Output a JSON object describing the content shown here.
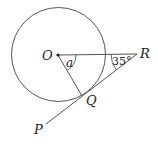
{
  "diagram": {
    "type": "geometry",
    "colors": {
      "stroke": "#555555",
      "text": "#222222",
      "background": "#ffffff"
    },
    "circle": {
      "center_label": "O",
      "cx": 58.5,
      "cy": 54.5,
      "r": 47
    },
    "points": {
      "O": {
        "label": "O",
        "x": 58,
        "y": 55
      },
      "R": {
        "label": "R",
        "x": 137,
        "y": 54
      },
      "Q": {
        "label": "Q",
        "x": 82,
        "y": 96
      },
      "P": {
        "label": "P",
        "x": 46,
        "y": 124
      }
    },
    "angles": {
      "a": {
        "label": "a",
        "vertex": "O"
      },
      "r": {
        "label": "35°",
        "vertex": "R",
        "value_deg": 35
      }
    },
    "segments": [
      "OR",
      "OQ",
      "PR"
    ]
  }
}
